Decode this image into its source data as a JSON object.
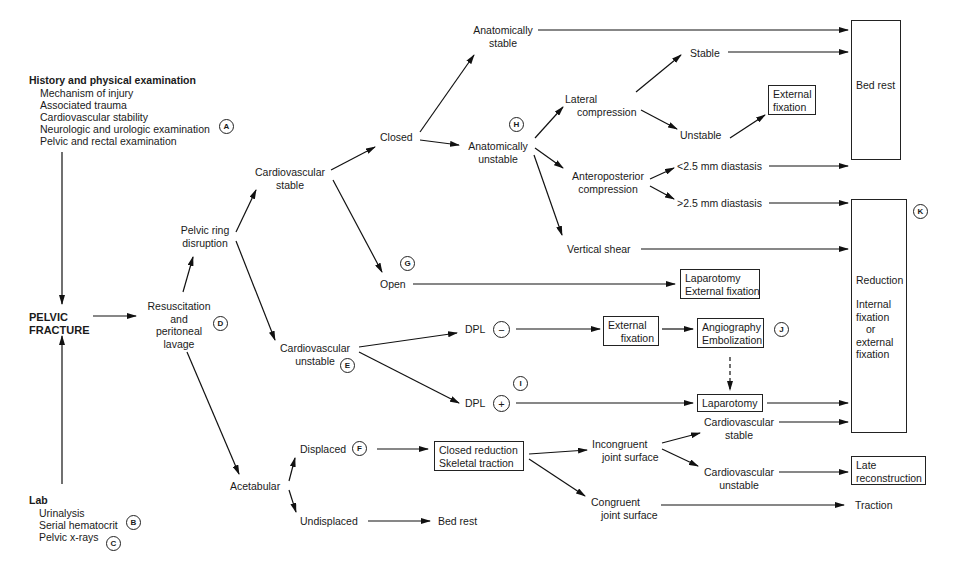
{
  "history": {
    "heading": "History and physical examination",
    "items": [
      "Mechanism of injury",
      "Associated trauma",
      "Cardiovascular stability",
      "Neurologic and urologic examination",
      "Pelvic and rectal examination"
    ],
    "marker": "A"
  },
  "lab": {
    "heading": "Lab",
    "items": [
      "Urinalysis",
      "Serial hematocrit",
      "Pelvic x-rays"
    ],
    "markers": [
      "B",
      "C"
    ]
  },
  "root": {
    "line1": "PELVIC",
    "line2": "FRACTURE"
  },
  "resuscitation": {
    "lines": [
      "Resuscitation",
      "and",
      "peritoneal",
      "lavage"
    ],
    "marker": "D"
  },
  "pelvic_ring": {
    "line1": "Pelvic ring",
    "line2": "disruption"
  },
  "cv_stable": {
    "line1": "Cardiovascular",
    "line2": "stable"
  },
  "cv_unstable": {
    "line1": "Cardiovascular",
    "line2": "unstable",
    "marker": "E"
  },
  "closed": "Closed",
  "open": {
    "label": "Open",
    "marker": "G"
  },
  "anat_stable": {
    "line1": "Anatomically",
    "line2": "stable"
  },
  "anat_unstable": {
    "line1": "Anatomically",
    "line2": "unstable",
    "marker": "H"
  },
  "lateral": {
    "line1": "Lateral",
    "line2": "compression"
  },
  "stable": "Stable",
  "unstable": "Unstable",
  "ext_fix_box": {
    "line1": "External",
    "line2": "fixation"
  },
  "ap": {
    "line1": "Anteroposterior",
    "line2": "compression"
  },
  "lt_diastasis": "<2.5 mm diastasis",
  "gt_diastasis": ">2.5 mm diastasis",
  "vertical_shear": "Vertical shear",
  "lap_ext_box": {
    "line1": "Laparotomy",
    "line2": "External fixation"
  },
  "dpl_neg": {
    "label": "DPL",
    "sign": "−"
  },
  "dpl_pos": {
    "label": "DPL",
    "sign": "+",
    "marker": "I"
  },
  "ext_fix_box2": {
    "line1": "External",
    "line2": "fixation"
  },
  "angio_box": {
    "line1": "Angiography",
    "line2": "Embolization",
    "marker": "J"
  },
  "laparotomy_box": "Laparotomy",
  "bed_rest_box": "Bed rest",
  "reduction_box": {
    "title": "Reduction",
    "lines": [
      "Internal",
      "fixation",
      "or",
      "external",
      "fixation"
    ],
    "marker": "K"
  },
  "acetabular": "Acetabular",
  "displaced": {
    "label": "Displaced",
    "marker": "F"
  },
  "undisplaced": "Undisplaced",
  "bed_rest_text": "Bed rest",
  "closed_red_box": {
    "line1": "Closed reduction",
    "line2": "Skeletal traction"
  },
  "incongruent": {
    "line1": "Incongruent",
    "line2": "joint surface"
  },
  "congruent": {
    "line1": "Congruent",
    "line2": "joint surface"
  },
  "cv_stable2": {
    "line1": "Cardiovascular",
    "line2": "stable"
  },
  "cv_unstable2": {
    "line1": "Cardiovascular",
    "line2": "unstable"
  },
  "late_box": {
    "line1": "Late",
    "line2": "reconstruction"
  },
  "traction": "Traction"
}
